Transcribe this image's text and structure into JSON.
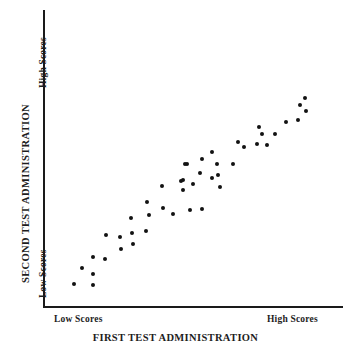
{
  "chart_data": {
    "type": "scatter",
    "title": "",
    "xlabel": "FIRST TEST ADMINISTRATION",
    "ylabel": "SECOND TEST ADMINISTRATION",
    "x_tick_labels": [
      "Low Scores",
      "High Scores"
    ],
    "y_tick_labels": [
      "Low Scores",
      "High Scores"
    ],
    "xlim": [
      0,
      100
    ],
    "ylim": [
      0,
      100
    ],
    "grid": false,
    "legend": null,
    "marker": {
      "shape": "circle",
      "color": "#121212",
      "size_px": 4
    },
    "axis_color": "#1a1a1a",
    "points": [
      {
        "x": 9.7,
        "y": 7.7
      },
      {
        "x": 12.3,
        "y": 13.1
      },
      {
        "x": 16.3,
        "y": 7.4
      },
      {
        "x": 16.3,
        "y": 16.8
      },
      {
        "x": 20.3,
        "y": 16.1
      },
      {
        "x": 16.0,
        "y": 11.1
      },
      {
        "x": 20.7,
        "y": 24.4
      },
      {
        "x": 25.7,
        "y": 19.5
      },
      {
        "x": 25.3,
        "y": 23.5
      },
      {
        "x": 29.0,
        "y": 29.9
      },
      {
        "x": 29.3,
        "y": 24.8
      },
      {
        "x": 29.7,
        "y": 21.1
      },
      {
        "x": 34.3,
        "y": 35.2
      },
      {
        "x": 34.0,
        "y": 25.5
      },
      {
        "x": 35.0,
        "y": 30.9
      },
      {
        "x": 39.3,
        "y": 40.6
      },
      {
        "x": 39.7,
        "y": 33.2
      },
      {
        "x": 43.0,
        "y": 31.2
      },
      {
        "x": 45.7,
        "y": 42.3
      },
      {
        "x": 46.3,
        "y": 39.3
      },
      {
        "x": 47.7,
        "y": 48.0
      },
      {
        "x": 48.7,
        "y": 32.5
      },
      {
        "x": 47.3,
        "y": 48.3
      },
      {
        "x": 46.3,
        "y": 42.6
      },
      {
        "x": 49.7,
        "y": 41.3
      },
      {
        "x": 52.3,
        "y": 45.0
      },
      {
        "x": 52.7,
        "y": 32.9
      },
      {
        "x": 53.0,
        "y": 50.0
      },
      {
        "x": 56.3,
        "y": 52.3
      },
      {
        "x": 56.3,
        "y": 43.6
      },
      {
        "x": 58.0,
        "y": 48.0
      },
      {
        "x": 58.3,
        "y": 44.3
      },
      {
        "x": 59.0,
        "y": 40.3
      },
      {
        "x": 63.3,
        "y": 48.0
      },
      {
        "x": 65.0,
        "y": 55.7
      },
      {
        "x": 67.0,
        "y": 54.0
      },
      {
        "x": 71.3,
        "y": 55.0
      },
      {
        "x": 72.0,
        "y": 60.7
      },
      {
        "x": 73.0,
        "y": 58.1
      },
      {
        "x": 74.7,
        "y": 54.7
      },
      {
        "x": 77.3,
        "y": 58.4
      },
      {
        "x": 81.3,
        "y": 62.4
      },
      {
        "x": 85.3,
        "y": 63.1
      },
      {
        "x": 85.7,
        "y": 68.1
      },
      {
        "x": 88.0,
        "y": 66.1
      },
      {
        "x": 87.7,
        "y": 70.5
      }
    ]
  },
  "axes": {
    "y_title": "SECOND TEST ADMINISTRATION",
    "y_high": "High Scores",
    "y_low": "Low Scores",
    "x_title": "FIRST TEST ADMINISTRATION",
    "x_low": "Low Scores",
    "x_high": "High Scores"
  }
}
